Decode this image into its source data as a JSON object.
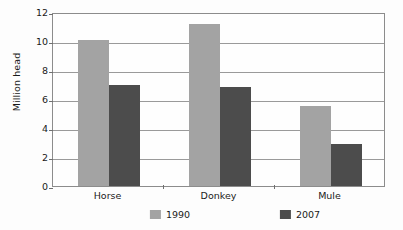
{
  "chart_data": {
    "type": "bar",
    "title": "",
    "subtitle": "",
    "xlabel": "",
    "ylabel": "Million head",
    "categories": [
      "Horse",
      "Donkey",
      "Mule"
    ],
    "series": [
      {
        "name": "1990",
        "color": "#a3a3a3",
        "values": [
          10.1,
          11.2,
          5.5
        ]
      },
      {
        "name": "2007",
        "color": "#4c4c4c",
        "values": [
          7.0,
          6.8,
          2.9
        ]
      }
    ],
    "ylim": [
      0,
      12
    ],
    "ytick_values": [
      0,
      2,
      4,
      6,
      8,
      10,
      12
    ],
    "ytick_labels": [
      "0",
      "2",
      "4",
      "6",
      "8",
      "10",
      "12"
    ],
    "grid": true,
    "grid_axis": "y",
    "legend": true,
    "legend_position": "bottom",
    "legend_entries": [
      "1990",
      "2007"
    ]
  },
  "axes": {
    "y_title": "Million head"
  }
}
